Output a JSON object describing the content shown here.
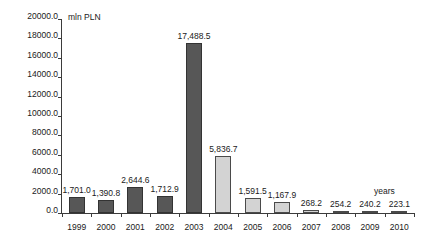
{
  "chart_data": {
    "type": "bar",
    "title": "",
    "subtitle": "",
    "xlabel": "years",
    "ylabel": "mln PLN",
    "categories": [
      "1999",
      "2000",
      "2001",
      "2002",
      "2003",
      "2004",
      "2005",
      "2006",
      "2007",
      "2008",
      "2009",
      "2010"
    ],
    "values": [
      1701.0,
      1390.8,
      2644.6,
      1712.9,
      17488.5,
      5836.7,
      1591.5,
      1167.9,
      268.2,
      254.2,
      240.2,
      223.1
    ],
    "value_labels": [
      "1,701.0",
      "1,390.8",
      "2,644.6",
      "1,712.9",
      "17,488.5",
      "5,836.7",
      "1,591.5",
      "1,167.9",
      "268.2",
      "254.2",
      "240.2",
      "223.1"
    ],
    "bar_styles": [
      "dark",
      "dark",
      "dark",
      "dark",
      "dark",
      "light",
      "light",
      "light",
      "light",
      "light",
      "light",
      "light"
    ],
    "ylim": [
      0,
      20000
    ],
    "ytick_step": 2000,
    "ytick_labels": [
      "20000.0",
      "18000.0",
      "16000.0",
      "14000.0",
      "12000.0",
      "10000.0",
      "8000.0",
      "6000.0",
      "4000.0",
      "2000.0",
      "0.0"
    ],
    "ytick_values": [
      20000,
      18000,
      16000,
      14000,
      12000,
      10000,
      8000,
      6000,
      4000,
      2000,
      0
    ],
    "grid": false,
    "legend": false,
    "colors": {
      "bar_dark": "#575757",
      "bar_light": "#d3d3d3",
      "bar_border": "#333333",
      "axis": "#3b3b3b",
      "text": "#1a1a1a",
      "background": "#ffffff"
    }
  }
}
